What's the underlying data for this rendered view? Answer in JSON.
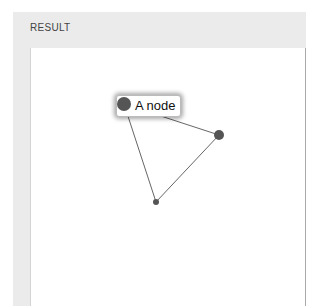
{
  "panel": {
    "title": "RESULT"
  },
  "graph": {
    "nodes": [
      {
        "id": "n1",
        "label": "A node",
        "x": 124,
        "y": 104,
        "r": 6,
        "highlighted": true
      },
      {
        "id": "n2",
        "x": 219,
        "y": 135,
        "r": 5
      },
      {
        "id": "n3",
        "x": 156,
        "y": 202,
        "r": 3
      }
    ],
    "edges": [
      [
        "n1",
        "n2"
      ],
      [
        "n1",
        "n3"
      ],
      [
        "n2",
        "n3"
      ]
    ],
    "colors": {
      "node": "#555555",
      "edge": "#666666"
    }
  }
}
